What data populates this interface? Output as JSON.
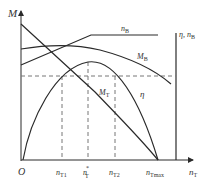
{
  "diagram": {
    "title": "",
    "axes": {
      "y_left_label": "M",
      "x_label": "n",
      "x_label_sub": "T",
      "origin_label": "O",
      "y_right_label": "η, n",
      "y_right_label_sub": "B"
    },
    "x_ticks": [
      {
        "main": "n",
        "sub": "T1",
        "sup": ""
      },
      {
        "main": "n",
        "sub": "T",
        "sup": "*"
      },
      {
        "main": "n",
        "sub": "T2",
        "sup": ""
      },
      {
        "main": "n",
        "sub": "Tmax",
        "sup": ""
      }
    ],
    "curves": [
      {
        "id": "nB",
        "main": "n",
        "sub": "B"
      },
      {
        "id": "MB",
        "main": "M",
        "sub": "B"
      },
      {
        "id": "MT",
        "main": "M",
        "sub": "T"
      },
      {
        "id": "eta",
        "main": "η",
        "sub": ""
      }
    ],
    "colors": {
      "line": "#2a2a2a",
      "dashed": "#777777",
      "background": "#ffffff"
    }
  }
}
